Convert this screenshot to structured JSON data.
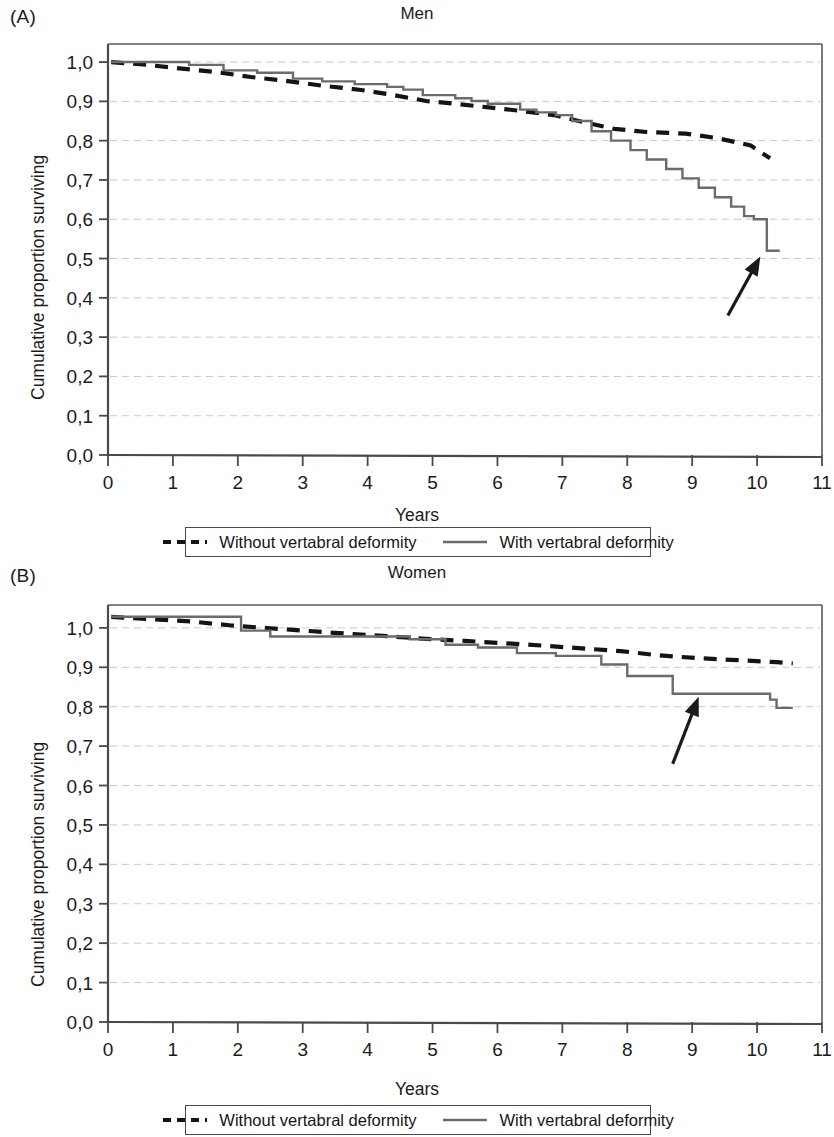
{
  "figure": {
    "panels": [
      {
        "letter": "(A)",
        "title": "Men",
        "ylabel": "Cumulative proportion surviving",
        "xlabel": "Years"
      },
      {
        "letter": "(B)",
        "title": "Women",
        "ylabel": "Cumulative proportion surviving",
        "xlabel": "Years"
      }
    ],
    "legend": {
      "without_label": "Without vertabral deformity",
      "with_label": "With vertabral deformity",
      "without_style": "dashed",
      "with_style": "solid"
    },
    "colors": {
      "dashed_series": "#141414",
      "solid_series": "#6b6b6b",
      "axis": "#4a4a4a",
      "grid": "#c9c9c9",
      "text": "#1b1b1b",
      "background": "#ffffff"
    }
  },
  "chart_data": [
    {
      "type": "line",
      "title": "Men",
      "panel": "(A)",
      "xlabel": "Years",
      "ylabel": "Cumulative proportion surviving",
      "xlim": [
        0,
        11
      ],
      "ylim": [
        0,
        1.0
      ],
      "xticks": [
        0,
        1,
        2,
        3,
        4,
        5,
        6,
        7,
        8,
        9,
        10,
        11
      ],
      "xticklabels": [
        "0",
        "1",
        "2",
        "3",
        "4",
        "5",
        "6",
        "7",
        "8",
        "9",
        "10",
        "11"
      ],
      "yticks": [
        0.0,
        0.1,
        0.2,
        0.3,
        0.4,
        0.5,
        0.6,
        0.7,
        0.8,
        0.9,
        1.0
      ],
      "yticklabels": [
        "0,0",
        "0,1",
        "0,2",
        "0,3",
        "0,4",
        "0,5",
        "0,6",
        "0,7",
        "0,8",
        "0,9",
        "1,0"
      ],
      "grid": true,
      "legend_position": "below",
      "annotations": [
        {
          "type": "arrow",
          "points_to_x": 10.05,
          "points_to_y": 0.505,
          "tail_x": 9.55,
          "tail_y": 0.355
        }
      ],
      "series": [
        {
          "name": "Without vertabral deformity",
          "style": "dashed",
          "x": [
            0.05,
            0.6,
            1.1,
            1.7,
            2.2,
            2.8,
            3.3,
            3.9,
            4.4,
            4.9,
            5.4,
            5.9,
            6.4,
            6.9,
            7.3,
            7.8,
            8.3,
            8.9,
            9.4,
            9.9,
            10.2
          ],
          "y": [
            1.0,
            0.993,
            0.984,
            0.974,
            0.962,
            0.951,
            0.94,
            0.929,
            0.916,
            0.901,
            0.893,
            0.884,
            0.875,
            0.864,
            0.848,
            0.83,
            0.822,
            0.818,
            0.806,
            0.788,
            0.755
          ]
        },
        {
          "name": "With vertabral deformity",
          "style": "solid-step",
          "x": [
            0.05,
            0.95,
            1.25,
            1.6,
            1.78,
            2.1,
            2.3,
            2.55,
            2.85,
            3.1,
            3.3,
            3.55,
            3.8,
            4.05,
            4.3,
            4.55,
            4.85,
            5.1,
            5.35,
            5.6,
            5.85,
            6.1,
            6.35,
            6.6,
            6.9,
            7.15,
            7.45,
            7.75,
            8.05,
            8.3,
            8.6,
            8.85,
            9.1,
            9.35,
            9.6,
            9.8,
            9.95,
            10.15,
            10.35
          ],
          "y": [
            1.0,
            1.0,
            0.993,
            0.993,
            0.979,
            0.979,
            0.973,
            0.973,
            0.958,
            0.958,
            0.951,
            0.951,
            0.944,
            0.944,
            0.937,
            0.93,
            0.916,
            0.916,
            0.908,
            0.901,
            0.894,
            0.894,
            0.879,
            0.872,
            0.865,
            0.85,
            0.824,
            0.8,
            0.776,
            0.752,
            0.728,
            0.704,
            0.68,
            0.656,
            0.632,
            0.608,
            0.6,
            0.52,
            0.52
          ]
        }
      ]
    },
    {
      "type": "line",
      "title": "Women",
      "panel": "(B)",
      "xlabel": "Years",
      "ylabel": "Cumulative proportion surviving",
      "xlim": [
        0,
        11
      ],
      "ylim": [
        0,
        1.0
      ],
      "xticks": [
        0,
        1,
        2,
        3,
        4,
        5,
        6,
        7,
        8,
        9,
        10,
        11
      ],
      "xticklabels": [
        "0",
        "1",
        "2",
        "3",
        "4",
        "5",
        "6",
        "7",
        "8",
        "9",
        "10",
        "11"
      ],
      "yticks": [
        0.0,
        0.1,
        0.2,
        0.3,
        0.4,
        0.5,
        0.6,
        0.7,
        0.8,
        0.9,
        1.0
      ],
      "yticklabels": [
        "0,0",
        "0,1",
        "0,2",
        "0,3",
        "0,4",
        "0,5",
        "0,6",
        "0,7",
        "0,8",
        "0,9",
        "1,0"
      ],
      "grid": true,
      "legend_position": "below",
      "annotations": [
        {
          "type": "arrow",
          "points_to_x": 9.1,
          "points_to_y": 0.825,
          "tail_x": 8.7,
          "tail_y": 0.655
        }
      ],
      "series": [
        {
          "name": "Without vertabral deformity",
          "style": "dashed",
          "x": [
            0.05,
            0.7,
            1.3,
            1.9,
            2.5,
            3.1,
            3.7,
            4.3,
            4.9,
            5.5,
            6.1,
            6.7,
            7.3,
            7.9,
            8.5,
            9.1,
            9.7,
            10.3,
            10.55
          ],
          "y": [
            1.028,
            1.022,
            1.016,
            1.006,
            0.999,
            0.992,
            0.985,
            0.979,
            0.972,
            0.967,
            0.961,
            0.955,
            0.948,
            0.941,
            0.93,
            0.923,
            0.918,
            0.913,
            0.91
          ]
        },
        {
          "name": "With vertabral deformity",
          "style": "solid-step",
          "x": [
            0.05,
            1.85,
            2.05,
            2.3,
            2.5,
            4.45,
            4.65,
            5.0,
            5.2,
            5.5,
            5.7,
            6.05,
            6.3,
            6.65,
            6.9,
            7.35,
            7.6,
            7.85,
            8.0,
            8.5,
            8.7,
            10.0,
            10.2,
            10.3,
            10.55
          ],
          "y": [
            1.028,
            1.028,
            0.993,
            0.993,
            0.978,
            0.978,
            0.971,
            0.971,
            0.957,
            0.957,
            0.95,
            0.95,
            0.936,
            0.936,
            0.929,
            0.929,
            0.907,
            0.907,
            0.878,
            0.878,
            0.833,
            0.833,
            0.818,
            0.797,
            0.797
          ]
        }
      ]
    }
  ]
}
